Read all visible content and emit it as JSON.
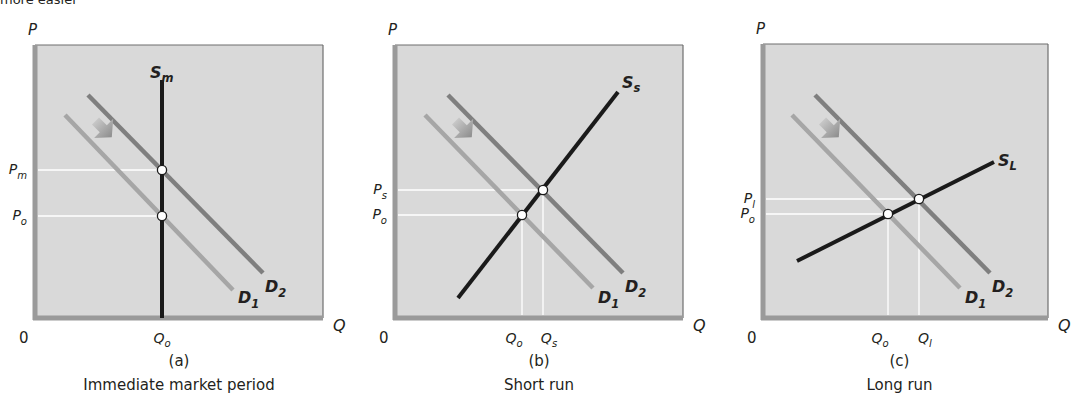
{
  "header_fragment": "more easier",
  "colors": {
    "plot_bg": "#d9d9d9",
    "axis": "#9a9a9a",
    "frame": "#6e6e6e",
    "supply": "#1a1a1a",
    "d1": "#a6a6a6",
    "d2": "#7f7f7f",
    "guide": "#ffffff",
    "point_fill": "#ffffff",
    "arrow": "#9e9e9e"
  },
  "chart_data": [
    {
      "type": "line",
      "panel_label": "(a)",
      "title": "Immediate market period",
      "xlabel": "Q",
      "ylabel": "P",
      "origin_label": "0",
      "grid": false,
      "box": {
        "x": 35,
        "y": 45,
        "w": 288,
        "h": 273
      },
      "series": [
        {
          "name": "S",
          "sub": "m",
          "role": "supply",
          "x1": 162,
          "y1": 80,
          "x2": 162,
          "y2": 318,
          "label_x": 150,
          "label_y": 78
        },
        {
          "name": "D",
          "sub": "1",
          "role": "d1",
          "x1": 65,
          "y1": 115,
          "x2": 233,
          "y2": 290,
          "label_x": 238,
          "label_y": 303
        },
        {
          "name": "D",
          "sub": "2",
          "role": "d2",
          "x1": 88,
          "y1": 95,
          "x2": 263,
          "y2": 273,
          "label_x": 265,
          "label_y": 292
        }
      ],
      "equilibria": [
        {
          "x": 162,
          "y": 216,
          "p": "P",
          "p_sub": "o",
          "q": "Q",
          "q_sub": "o"
        },
        {
          "x": 162,
          "y": 170,
          "p": "P",
          "p_sub": "m",
          "q": null,
          "q_sub": null
        }
      ],
      "price_ticks": [
        {
          "label": "P",
          "sub": "m",
          "y": 170
        },
        {
          "label": "P",
          "sub": "o",
          "y": 216
        }
      ],
      "quantity_ticks": [
        {
          "label": "Q",
          "sub": "o",
          "x": 162
        }
      ],
      "shift_arrow": {
        "x": 100,
        "y": 128
      },
      "note": "Demand shifts right from D1 to D2; vertical supply means price rises from Po to Pm with quantity fixed at Qo."
    },
    {
      "type": "line",
      "panel_label": "(b)",
      "title": "Short run",
      "xlabel": "Q",
      "ylabel": "P",
      "origin_label": "0",
      "grid": false,
      "box": {
        "x": 395,
        "y": 45,
        "w": 288,
        "h": 273
      },
      "series": [
        {
          "name": "S",
          "sub": "s",
          "role": "supply",
          "x1": 458,
          "y1": 298,
          "x2": 618,
          "y2": 92,
          "label_x": 622,
          "label_y": 88
        },
        {
          "name": "D",
          "sub": "1",
          "role": "d1",
          "x1": 425,
          "y1": 115,
          "x2": 593,
          "y2": 288,
          "label_x": 598,
          "label_y": 303
        },
        {
          "name": "D",
          "sub": "2",
          "role": "d2",
          "x1": 448,
          "y1": 95,
          "x2": 623,
          "y2": 273,
          "label_x": 625,
          "label_y": 292
        }
      ],
      "equilibria": [
        {
          "x": 522,
          "y": 215,
          "p": "P",
          "p_sub": "o",
          "q": "Q",
          "q_sub": "o"
        },
        {
          "x": 543,
          "y": 190,
          "p": "P",
          "p_sub": "s",
          "q": "Q",
          "q_sub": "s"
        }
      ],
      "price_ticks": [
        {
          "label": "P",
          "sub": "s",
          "y": 190
        },
        {
          "label": "P",
          "sub": "o",
          "y": 215
        }
      ],
      "quantity_ticks": [
        {
          "label": "Q",
          "sub": "o",
          "x": 522
        },
        {
          "label": "Q",
          "sub": "s",
          "x": 543
        }
      ],
      "shift_arrow": {
        "x": 460,
        "y": 128
      },
      "note": "Upward-sloping short-run supply: both price and quantity rise."
    },
    {
      "type": "line",
      "panel_label": "(c)",
      "title": "Long run",
      "xlabel": "Q",
      "ylabel": "P",
      "origin_label": "0",
      "grid": false,
      "box": {
        "x": 763,
        "y": 44,
        "w": 285,
        "h": 274
      },
      "series": [
        {
          "name": "S",
          "sub": "L",
          "role": "supply",
          "x1": 797,
          "y1": 261,
          "x2": 994,
          "y2": 162,
          "label_x": 998,
          "label_y": 166
        },
        {
          "name": "D",
          "sub": "1",
          "role": "d1",
          "x1": 792,
          "y1": 115,
          "x2": 960,
          "y2": 288,
          "label_x": 965,
          "label_y": 303
        },
        {
          "name": "D",
          "sub": "2",
          "role": "d2",
          "x1": 815,
          "y1": 95,
          "x2": 990,
          "y2": 273,
          "label_x": 992,
          "label_y": 292
        }
      ],
      "equilibria": [
        {
          "x": 888,
          "y": 214,
          "p": "P",
          "p_sub": "o",
          "q": "Q",
          "q_sub": "o"
        },
        {
          "x": 919,
          "y": 199,
          "p": "P",
          "p_sub": "l",
          "q": "Q",
          "q_sub": "l"
        }
      ],
      "price_ticks": [
        {
          "label": "P",
          "sub": "l",
          "y": 199
        },
        {
          "label": "P",
          "sub": "o",
          "y": 214
        }
      ],
      "quantity_ticks": [
        {
          "label": "Q",
          "sub": "o",
          "x": 888
        },
        {
          "label": "Q",
          "sub": "l",
          "x": 919
        }
      ],
      "shift_arrow": {
        "x": 827,
        "y": 128
      },
      "note": "Flatter long-run supply: larger quantity increase, smaller price increase."
    }
  ]
}
